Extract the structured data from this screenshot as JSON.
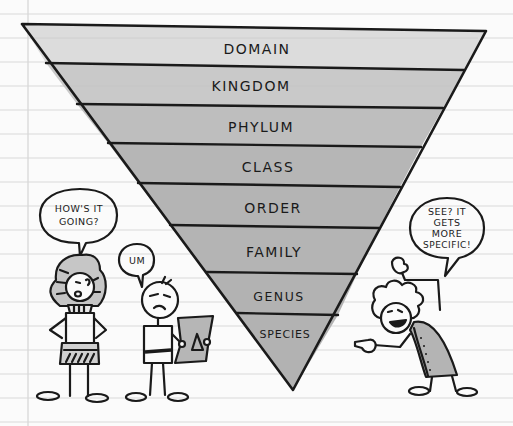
{
  "diagram": {
    "levels": [
      {
        "label": "DOMAIN",
        "fill": "#dcdcdc"
      },
      {
        "label": "KINGDOM",
        "fill": "#c9c9c9"
      },
      {
        "label": "PHYLUM",
        "fill": "#bebebe"
      },
      {
        "label": "CLASS",
        "fill": "#b6b6b6"
      },
      {
        "label": "ORDER",
        "fill": "#b4b4b4"
      },
      {
        "label": "FAMILY",
        "fill": "#b4b4b4"
      },
      {
        "label": "GENUS",
        "fill": "#b2b2b2"
      },
      {
        "label": "SPECIES",
        "fill": "#b2b2b2"
      }
    ]
  },
  "characters": {
    "pharaoh": {
      "speech_line1": "HOW'S IT",
      "speech_line2": "GOING?"
    },
    "boy": {
      "speech": "UM"
    },
    "scholar": {
      "speech_line1": "SEE? IT",
      "speech_line2": "GETS",
      "speech_line3": "MORE",
      "speech_line4": "SPECIFIC!"
    }
  },
  "colors": {
    "paper": "#fbfbfb",
    "rule_line": "#d9d9d9",
    "ink": "#1a1a1a",
    "shade": "#b4b4b4"
  }
}
